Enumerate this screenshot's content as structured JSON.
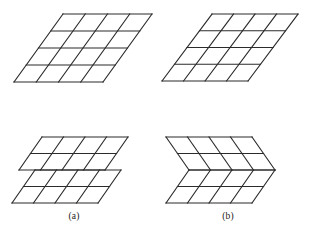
{
  "figure": {
    "background_color": "#ffffff",
    "line_color": "#2b2b2b",
    "line_width": 1.15,
    "canvas": {
      "width": 311,
      "height": 228
    }
  },
  "captions": {
    "a": {
      "label": "(a)",
      "x": 74,
      "y": 219
    },
    "b": {
      "label": "(b)",
      "x": 228,
      "y": 219
    }
  },
  "panels": [
    {
      "id": "top-left-grid",
      "name": "plain-parallelogram-grid-top-left",
      "type": "parallelogram-grid",
      "rows": 4,
      "cols": 4,
      "origin": {
        "x": 14,
        "y": 82
      },
      "u": {
        "x": 22.25,
        "y": 0
      },
      "v": {
        "x": 12.25,
        "y": -17.0
      },
      "corners": {
        "bottom_left": {
          "x": 14,
          "y": 82
        },
        "bottom_right": {
          "x": 103,
          "y": 82
        },
        "top_right": {
          "x": 152,
          "y": 14
        },
        "top_left": {
          "x": 63,
          "y": 14
        }
      }
    },
    {
      "id": "top-right-grid",
      "name": "plain-parallelogram-grid-top-right",
      "type": "parallelogram-grid",
      "rows": 4,
      "cols": 4,
      "origin": {
        "x": 162,
        "y": 81
      },
      "u": {
        "x": 21.5,
        "y": 0
      },
      "v": {
        "x": 12.5,
        "y": -16.75
      },
      "corners": {
        "bottom_left": {
          "x": 162,
          "y": 81
        },
        "bottom_right": {
          "x": 248,
          "y": 81
        },
        "top_right": {
          "x": 298,
          "y": 14
        },
        "top_left": {
          "x": 212,
          "y": 14
        }
      }
    },
    {
      "id": "bottom-left-offset-grid",
      "name": "offset-parallelogram-grid-a",
      "type": "offset-parallelogram-grid",
      "rows_per_band": 2,
      "bands": 2,
      "cols": 4,
      "band_offset_x": -16,
      "lower_origin": {
        "x": 12,
        "y": 203
      },
      "u": {
        "x": 21.5,
        "y": 0
      },
      "v": {
        "x": 11.5,
        "y": -16.5
      }
    },
    {
      "id": "bottom-right-chevron-grid",
      "name": "chevron-parallelogram-grid-b",
      "type": "chevron-parallelogram-grid",
      "rows_per_band": 2,
      "bands": 2,
      "cols": 4,
      "lower_origin": {
        "x": 166,
        "y": 203
      },
      "u": {
        "x": 21.5,
        "y": 0
      },
      "v_lower": {
        "x": 11.5,
        "y": -16.5
      },
      "v_upper": {
        "x": -11.5,
        "y": -16.5
      },
      "apex": {
        "x": 166,
        "y": 170
      }
    }
  ]
}
